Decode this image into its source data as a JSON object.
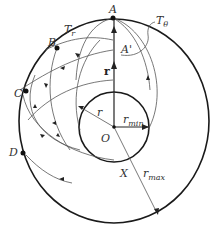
{
  "diagram": {
    "points": {
      "A": "A",
      "A_prime": "A'",
      "B": "B",
      "C": "C",
      "D": "D",
      "O": "O",
      "X": "X"
    },
    "labels": {
      "T_r": "T",
      "T_r_sub": "r",
      "T_theta": "T",
      "T_theta_sub": "θ",
      "r_vec": "r",
      "r": "r",
      "r_min": "r",
      "r_min_sub": "min",
      "r_max": "r",
      "r_max_sub": "max"
    },
    "colors": {
      "stroke": "#1a1a1a",
      "thin_stroke": "#555555",
      "background": "#ffffff"
    }
  }
}
